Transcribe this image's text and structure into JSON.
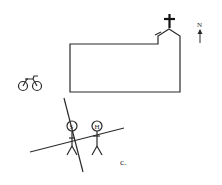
{
  "figure": {
    "compass_label": "N",
    "caption_label": "c.",
    "person_labels": [
      "S",
      "H"
    ],
    "icons": {
      "cross": "cross-icon",
      "bicycle": "bicycle-icon",
      "north_arrow": "north-arrow-icon"
    },
    "colors": {
      "ink": "#2a2a2a",
      "background": "#ffffff"
    }
  }
}
